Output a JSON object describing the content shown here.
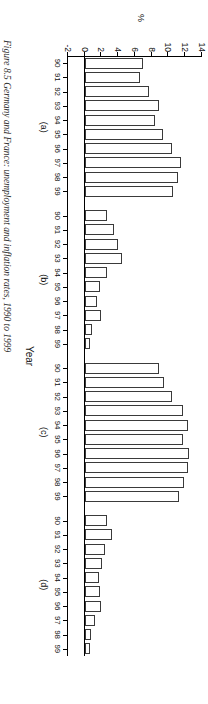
{
  "figure": {
    "caption": "Figure 8.5  Germany and France: unemployment and inflation rates, 1990 to 1999",
    "ylabel": "%",
    "xlabel": "Year"
  },
  "chart_data": {
    "type": "bar",
    "title": "Figure 8.5  Germany and France: unemployment and inflation rates, 1990 to 1999",
    "xlabel": "Year",
    "ylabel": "%",
    "ylim": [
      -2,
      14
    ],
    "yticks": [
      -2,
      0,
      2,
      4,
      6,
      8,
      10,
      12,
      14
    ],
    "ytick_labels": [
      "-2",
      "0",
      "2",
      "4",
      "6",
      "8",
      "10",
      "12",
      "14"
    ],
    "grid": false,
    "legend": "none",
    "categories": [
      "90",
      "91",
      "92",
      "93",
      "94",
      "95",
      "96",
      "97",
      "98",
      "99"
    ],
    "panels": [
      {
        "key": "a",
        "label": "(a)",
        "values": [
          7.0,
          6.6,
          7.7,
          8.9,
          8.4,
          9.4,
          10.4,
          11.5,
          11.1,
          10.5
        ]
      },
      {
        "key": "b",
        "label": "(b)",
        "values": [
          2.7,
          3.5,
          4.0,
          4.4,
          2.7,
          1.8,
          1.5,
          1.9,
          0.9,
          0.6
        ]
      },
      {
        "key": "c",
        "label": "(c)",
        "values": [
          8.9,
          9.5,
          10.4,
          11.7,
          12.3,
          11.7,
          12.4,
          12.3,
          11.8,
          11.3
        ]
      },
      {
        "key": "d",
        "label": "(d)",
        "values": [
          2.7,
          3.2,
          2.4,
          2.1,
          1.7,
          1.8,
          2.0,
          1.2,
          0.7,
          0.6
        ]
      }
    ]
  }
}
